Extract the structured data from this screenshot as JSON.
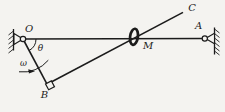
{
  "figure": {
    "type": "mechanism-diagram",
    "labels": {
      "O": "O",
      "A": "A",
      "B": "B",
      "C": "C",
      "M": "M",
      "theta": "θ",
      "omega": "ω"
    },
    "colors": {
      "ink": "#1b1b1b",
      "paper": "#f4f3f0"
    }
  }
}
